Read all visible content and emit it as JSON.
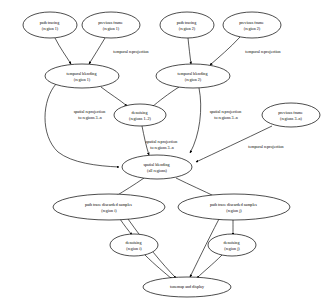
{
  "diagram": {
    "type": "directed-graph",
    "background_color": "#ffffff",
    "stroke_color": "#000000",
    "nodes": [
      {
        "id": "path_tracing_r1",
        "line1": "path tracing",
        "line2": "(region 1)",
        "cx": 50,
        "cy": 25,
        "rx": 27,
        "ry": 13
      },
      {
        "id": "prev_frame_r1",
        "line1": "previous frame",
        "line2": "(region 1)",
        "cx": 111,
        "cy": 25,
        "rx": 29,
        "ry": 13
      },
      {
        "id": "path_tracing_r2",
        "line1": "path tracing",
        "line2": "(region 2)",
        "cx": 187,
        "cy": 25,
        "rx": 27,
        "ry": 13
      },
      {
        "id": "prev_frame_r2",
        "line1": "previous frame",
        "line2": "(region 2)",
        "cx": 252,
        "cy": 25,
        "rx": 29,
        "ry": 13
      },
      {
        "id": "temporal_blend_r1",
        "line1": "temporal blending",
        "line2": "(region 1)",
        "cx": 82,
        "cy": 76,
        "rx": 37,
        "ry": 12
      },
      {
        "id": "temporal_blend_r2",
        "line1": "temporal blending",
        "line2": "(region 2)",
        "cx": 193,
        "cy": 76,
        "rx": 37,
        "ry": 12
      },
      {
        "id": "denoising_r12",
        "line1": "denoising",
        "line2": "(regions 1..2)",
        "cx": 140,
        "cy": 115,
        "rx": 26,
        "ry": 11
      },
      {
        "id": "prev_frame_r3n",
        "line1": "previous frame",
        "line2": "(regions 3..n)",
        "cx": 291,
        "cy": 115,
        "rx": 29,
        "ry": 12
      },
      {
        "id": "spatial_blend_all",
        "line1": "spatial blending",
        "line2": "(all regions)",
        "cx": 157,
        "cy": 167,
        "rx": 35,
        "ry": 12
      },
      {
        "id": "discarded_ri",
        "line1": "path trace discarded samples",
        "line2": "(region i)",
        "cx": 109,
        "cy": 207,
        "rx": 56,
        "ry": 13
      },
      {
        "id": "discarded_rj",
        "line1": "path trace discarded samples",
        "line2": "(region j)",
        "cx": 234,
        "cy": 207,
        "rx": 56,
        "ry": 13
      },
      {
        "id": "denoising_ri",
        "line1": "denoising",
        "line2": "(region i)",
        "cx": 134,
        "cy": 245,
        "rx": 24,
        "ry": 11
      },
      {
        "id": "denoising_rj",
        "line1": "denoising",
        "line2": "(region j)",
        "cx": 232,
        "cy": 245,
        "rx": 24,
        "ry": 11
      },
      {
        "id": "tonemap_display",
        "line1": "tonemap and display",
        "line2": "",
        "cx": 187,
        "cy": 287,
        "rx": 44,
        "ry": 10
      }
    ],
    "edge_labels": [
      {
        "id": "temporal_reproj_1",
        "line1": "temporal reprojection",
        "line2": "",
        "x": 131,
        "y": 52
      },
      {
        "id": "temporal_reproj_2",
        "line1": "temporal reprojection",
        "line2": "",
        "x": 263,
        "y": 52
      },
      {
        "id": "spatial_reproj_left",
        "line1": "spatial reprojection",
        "line2": "to regions 3..n",
        "x": 90,
        "y": 114
      },
      {
        "id": "spatial_reproj_right",
        "line1": "spatial reprojection",
        "line2": "to regions 3..n",
        "x": 226,
        "y": 114
      },
      {
        "id": "spatial_reproj_mid",
        "line1": "spatial reprojection",
        "line2": "to regions 3..n",
        "x": 162,
        "y": 144
      },
      {
        "id": "temporal_reproj_3",
        "line1": "temporal reprojection",
        "line2": "",
        "x": 266,
        "y": 147
      }
    ],
    "edges": [
      {
        "from": "path_tracing_r1",
        "to": "temporal_blend_r1",
        "label": ""
      },
      {
        "from": "prev_frame_r1",
        "to": "temporal_blend_r1",
        "label": "temporal reprojection"
      },
      {
        "from": "path_tracing_r2",
        "to": "temporal_blend_r2",
        "label": ""
      },
      {
        "from": "prev_frame_r2",
        "to": "temporal_blend_r2",
        "label": "temporal reprojection"
      },
      {
        "from": "temporal_blend_r1",
        "to": "denoising_r12",
        "label": ""
      },
      {
        "from": "temporal_blend_r2",
        "to": "denoising_r12",
        "label": ""
      },
      {
        "from": "temporal_blend_r1",
        "to": "spatial_blend_all",
        "label": "spatial reprojection to regions 3..n"
      },
      {
        "from": "temporal_blend_r2",
        "to": "spatial_blend_all",
        "label": "spatial reprojection to regions 3..n"
      },
      {
        "from": "denoising_r12",
        "to": "spatial_blend_all",
        "label": "spatial reprojection to regions 3..n"
      },
      {
        "from": "prev_frame_r3n",
        "to": "spatial_blend_all",
        "label": "temporal reprojection"
      },
      {
        "from": "spatial_blend_all",
        "to": "discarded_ri",
        "label": ""
      },
      {
        "from": "spatial_blend_all",
        "to": "discarded_rj",
        "label": ""
      },
      {
        "from": "discarded_ri",
        "to": "denoising_ri",
        "label": ""
      },
      {
        "from": "discarded_rj",
        "to": "denoising_rj",
        "label": ""
      },
      {
        "from": "discarded_ri",
        "to": "tonemap_display",
        "label": ""
      },
      {
        "from": "discarded_rj",
        "to": "tonemap_display",
        "label": ""
      },
      {
        "from": "denoising_ri",
        "to": "tonemap_display",
        "label": ""
      },
      {
        "from": "denoising_rj",
        "to": "tonemap_display",
        "label": ""
      }
    ]
  }
}
